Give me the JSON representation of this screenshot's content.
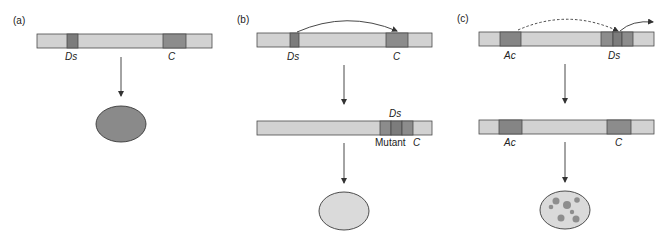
{
  "colors": {
    "chromosome_fill": "#d2d2d2",
    "element_ds": "#7c7c7c",
    "element_c": "#8c8c8c",
    "element_ac": "#858585",
    "outline": "#4a4a4a",
    "kernel_colored": "#8a8a8a",
    "kernel_colorless": "#dadada",
    "spot": "#8e8e8e"
  },
  "panels": [
    {
      "id": "a",
      "label": "(a)",
      "chromosome_top": {
        "labels": [
          "Ds",
          "C"
        ]
      },
      "outcome": "colored kernel"
    },
    {
      "id": "b",
      "label": "(b)",
      "chromosome_top": {
        "labels": [
          "Ds",
          "C"
        ]
      },
      "chromosome_bottom": {
        "labels": [
          "Ds",
          "Mutant C"
        ],
        "ds_label": "Ds",
        "mutant_prefix": "Mutant",
        "mutant_gene": "C"
      },
      "outcome": "colorless kernel"
    },
    {
      "id": "c",
      "label": "(c)",
      "chromosome_top": {
        "labels": [
          "Ac",
          "Ds"
        ]
      },
      "chromosome_bottom": {
        "labels": [
          "Ac",
          "C"
        ]
      },
      "outcome": "spotted kernel"
    }
  ]
}
